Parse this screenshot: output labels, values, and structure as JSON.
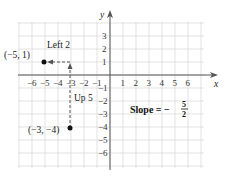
{
  "axes": {
    "x_label": "x",
    "y_label": "y",
    "x_ticks": [
      "−6",
      "−5",
      "−4",
      "−3",
      "−2",
      "−1",
      "1",
      "2",
      "3",
      "4",
      "5",
      "6"
    ],
    "x_tick_values": [
      -6,
      -5,
      -4,
      -3,
      -2,
      -1,
      1,
      2,
      3,
      4,
      5,
      6
    ],
    "y_ticks_pos": [
      "3",
      "2",
      "1"
    ],
    "y_ticks_pos_values": [
      3,
      2,
      1
    ],
    "y_ticks_neg": [
      "−1",
      "−2",
      "−3",
      "−4",
      "−5",
      "−6"
    ],
    "y_ticks_neg_values": [
      -1,
      -2,
      -3,
      -4,
      -5,
      -6
    ]
  },
  "points": [
    {
      "label": "(−5, 1)",
      "x": -5,
      "y": 1
    },
    {
      "label": "(−3, −4)",
      "x": -3,
      "y": -4
    }
  ],
  "annotations": {
    "left": "Left 2",
    "up": "Up 5",
    "slope_prefix": "Slope = −",
    "slope_num": "5",
    "slope_den": "2"
  },
  "colors": {
    "grid": "#d6d6d6",
    "axis": "#555555",
    "point": "#111111",
    "dash": "#555555"
  }
}
